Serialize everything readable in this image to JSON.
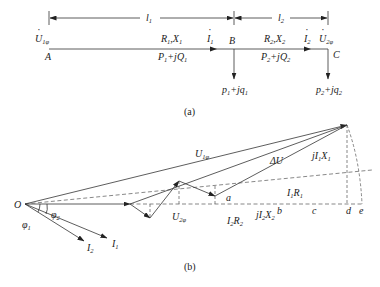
{
  "figure_a": {
    "caption": "(a)",
    "dimensions": {
      "l1": {
        "main": "l",
        "sub": "1"
      },
      "l2": {
        "main": "l",
        "sub": "2"
      }
    },
    "nodes": {
      "A": "A",
      "B": "B",
      "C": "C"
    },
    "source_voltage": {
      "main": "U",
      "sub": "1φ"
    },
    "end_voltage": {
      "main": "U",
      "sub": "2φ"
    },
    "segment1": {
      "impedance": {
        "r": "R",
        "rs": "1",
        "x": "X",
        "xs": "1"
      },
      "power": {
        "p": "P",
        "ps": "1",
        "q": "+jQ",
        "qs": "1"
      },
      "current": {
        "main": "I",
        "sub": "1"
      }
    },
    "segment2": {
      "impedance": {
        "r": "R",
        "rs": "2",
        "x": "X",
        "xs": "2"
      },
      "power": {
        "p": "P",
        "ps": "2",
        "q": "+jQ",
        "qs": "2"
      },
      "current": {
        "main": "I",
        "sub": "2"
      }
    },
    "load_B": {
      "p": "p",
      "ps": "1",
      "q": "+jq",
      "qs": "1"
    },
    "load_C": {
      "p": "p",
      "ps": "2",
      "q": "+jq",
      "qs": "2"
    }
  },
  "figure_b": {
    "caption": "(b)",
    "origin": "O",
    "phasors": {
      "U1": {
        "main": "U",
        "sub": "1φ"
      },
      "U2": {
        "main": "U",
        "sub": "2φ"
      },
      "dU": {
        "main": "ΔU"
      },
      "I1": {
        "main": "I",
        "sub": "1"
      },
      "I2": {
        "main": "I",
        "sub": "2"
      },
      "I2R2": {
        "a": "I",
        "as": "2",
        "b": "R",
        "bs": "2"
      },
      "jI2X2": {
        "a": "jI",
        "as": "2",
        "b": "X",
        "bs": "2"
      },
      "I1R1": {
        "a": "I",
        "as": "1",
        "b": "R",
        "bs": "1"
      },
      "jI1X1": {
        "a": "jI",
        "as": "1",
        "b": "X",
        "bs": "1"
      }
    },
    "angles": {
      "phi1": {
        "main": "φ",
        "sub": "1"
      },
      "phi2": {
        "main": "φ",
        "sub": "2"
      }
    },
    "points": [
      "a",
      "b",
      "c",
      "d",
      "e"
    ]
  }
}
